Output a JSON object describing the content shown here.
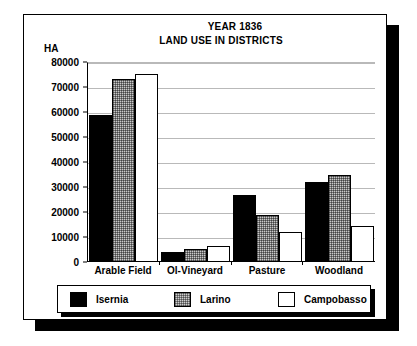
{
  "card": {
    "unit_label": "HA"
  },
  "chart_data": {
    "type": "bar",
    "title": "YEAR 1836",
    "subtitle": "LAND USE IN DISTRICTS",
    "xlabel": "",
    "ylabel": "HA",
    "ylim": [
      0,
      80000
    ],
    "ytick_labels": [
      "80000",
      "70000",
      "60000",
      "50000",
      "40000",
      "30000",
      "20000",
      "10000",
      "0"
    ],
    "ytick_values": [
      80000,
      70000,
      60000,
      50000,
      40000,
      30000,
      20000,
      10000,
      0
    ],
    "grid": true,
    "legend_position": "bottom",
    "categories": [
      "Arable Field",
      "Ol-Vineyard",
      "Pasture",
      "Woodland"
    ],
    "series": [
      {
        "name": "Isernia",
        "color": "#000000",
        "fill": "solid-black",
        "values": [
          58500,
          3800,
          26500,
          31500
        ]
      },
      {
        "name": "Larino",
        "color": "#c9c9c9",
        "fill": "dotted-gray",
        "values": [
          73000,
          5000,
          18500,
          34500
        ]
      },
      {
        "name": "Campobasso",
        "color": "#ffffff",
        "fill": "white-outline",
        "values": [
          75000,
          6200,
          11800,
          14000
        ]
      }
    ]
  }
}
